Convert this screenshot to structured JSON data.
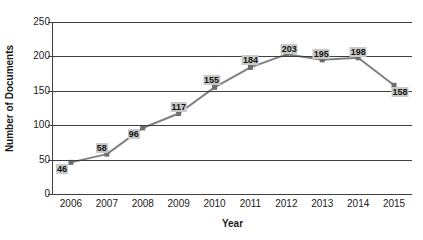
{
  "chart_data": {
    "type": "line",
    "title": "",
    "xlabel": "Year",
    "ylabel": "Number of Documents",
    "categories": [
      "2006",
      "2007",
      "2008",
      "2009",
      "2010",
      "2011",
      "2012",
      "2013",
      "2014",
      "2015"
    ],
    "values": [
      46,
      58,
      96,
      117,
      155,
      184,
      203,
      195,
      198,
      158
    ],
    "data_labels": [
      "46",
      "58",
      "96",
      "117",
      "155",
      "184",
      "203",
      "195",
      "198",
      "158"
    ],
    "ylim": [
      0,
      250
    ],
    "y_ticks": [
      "0",
      "50",
      "100",
      "150",
      "200",
      "250"
    ],
    "y_tick_values": [
      0,
      50,
      100,
      150,
      200,
      250
    ],
    "grid": true,
    "legend": "none",
    "series_color": "#808080",
    "marker": "square",
    "marker_color": "#6e6e6e",
    "gridline_color": "#3f3f3f",
    "label_background": "#c9c9c9"
  }
}
